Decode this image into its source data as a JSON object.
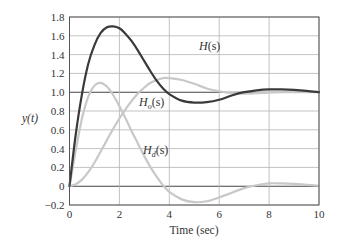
{
  "chart_data": {
    "type": "line",
    "title": "",
    "xlabel": "Time (sec)",
    "ylabel": "y(t)",
    "xlim": [
      0,
      10
    ],
    "ylim": [
      -0.2,
      1.8
    ],
    "xticks": [
      0,
      2,
      4,
      6,
      8,
      10
    ],
    "xtick_labels": [
      "0",
      "2",
      "4",
      "6",
      "8",
      "10"
    ],
    "yticks": [
      -0.2,
      0,
      0.2,
      0.4,
      0.6,
      0.8,
      1.0,
      1.2,
      1.4,
      1.6,
      1.8
    ],
    "ytick_labels": [
      "−0.2",
      "0",
      "0.2",
      "0.4",
      "0.6",
      "0.8",
      "1.0",
      "1.2",
      "1.4",
      "1.6",
      "1.8"
    ],
    "grid": true,
    "legend": "inline labels",
    "series": [
      {
        "name": "H(s)",
        "color": "#3a3a3a",
        "width": 2.2,
        "x": [
          0,
          0.25,
          0.5,
          0.75,
          1.0,
          1.25,
          1.5,
          1.75,
          2.0,
          2.25,
          2.5,
          2.75,
          3.0,
          3.25,
          3.5,
          3.75,
          4.0,
          4.5,
          5.0,
          5.5,
          6.0,
          6.5,
          7.0,
          7.5,
          8.0,
          8.5,
          9.0,
          9.5,
          10.0
        ],
        "values": [
          0,
          0.55,
          0.98,
          1.3,
          1.5,
          1.63,
          1.69,
          1.7,
          1.68,
          1.62,
          1.54,
          1.44,
          1.33,
          1.22,
          1.12,
          1.04,
          0.98,
          0.91,
          0.89,
          0.895,
          0.92,
          0.965,
          1.0,
          1.02,
          1.03,
          1.03,
          1.025,
          1.015,
          1.0
        ]
      },
      {
        "name": "H_o(s)",
        "color": "#c8c8c8",
        "width": 2.2,
        "x": [
          0,
          0.25,
          0.5,
          0.75,
          1.0,
          1.25,
          1.5,
          1.75,
          2.0,
          2.25,
          2.5,
          2.75,
          3.0,
          3.25,
          3.5,
          3.75,
          4.0,
          4.5,
          5.0,
          5.5,
          6.0,
          6.5,
          7.0,
          7.5,
          8.0,
          8.5,
          9.0,
          9.5,
          10.0
        ],
        "values": [
          0,
          0.02,
          0.07,
          0.15,
          0.25,
          0.37,
          0.49,
          0.61,
          0.72,
          0.82,
          0.91,
          0.99,
          1.05,
          1.1,
          1.13,
          1.15,
          1.15,
          1.13,
          1.09,
          1.04,
          1.01,
          0.99,
          0.985,
          0.99,
          0.995,
          1.0,
          1.0,
          1.0,
          1.0
        ]
      },
      {
        "name": "H_d(s)",
        "color": "#c8c8c8",
        "width": 2.2,
        "x": [
          0,
          0.25,
          0.5,
          0.75,
          1.0,
          1.25,
          1.5,
          1.75,
          2.0,
          2.25,
          2.5,
          2.75,
          3.0,
          3.25,
          3.5,
          3.75,
          4.0,
          4.5,
          5.0,
          5.5,
          6.0,
          6.5,
          7.0,
          7.5,
          8.0,
          8.5,
          9.0,
          9.5,
          10.0
        ],
        "values": [
          0,
          0.38,
          0.72,
          0.95,
          1.07,
          1.1,
          1.06,
          0.97,
          0.85,
          0.72,
          0.58,
          0.45,
          0.32,
          0.2,
          0.1,
          0.01,
          -0.06,
          -0.14,
          -0.17,
          -0.16,
          -0.12,
          -0.07,
          -0.02,
          0.01,
          0.03,
          0.03,
          0.025,
          0.015,
          0.005
        ]
      }
    ],
    "annotations": [
      {
        "text": "H(s)",
        "x": 5.2,
        "y": 1.45
      },
      {
        "text": "H_o(s)",
        "x": 2.8,
        "y": 0.88
      },
      {
        "text": "H_d(s)",
        "x": 3.2,
        "y": 0.38
      }
    ]
  },
  "labels": {
    "ylabel": "y(t)",
    "xlabel": "Time (sec)",
    "H": "H",
    "H_o_main": "H",
    "H_o_sub": "o",
    "H_d_main": "H",
    "H_d_sub": "d",
    "paren_s": "(s)"
  },
  "colors": {
    "axis": "#555555",
    "grid": "#b4b4b4",
    "zero_line": "#444444",
    "H": "#3a3a3a",
    "H_o": "#c8c8c8",
    "H_d": "#c8c8c8"
  }
}
